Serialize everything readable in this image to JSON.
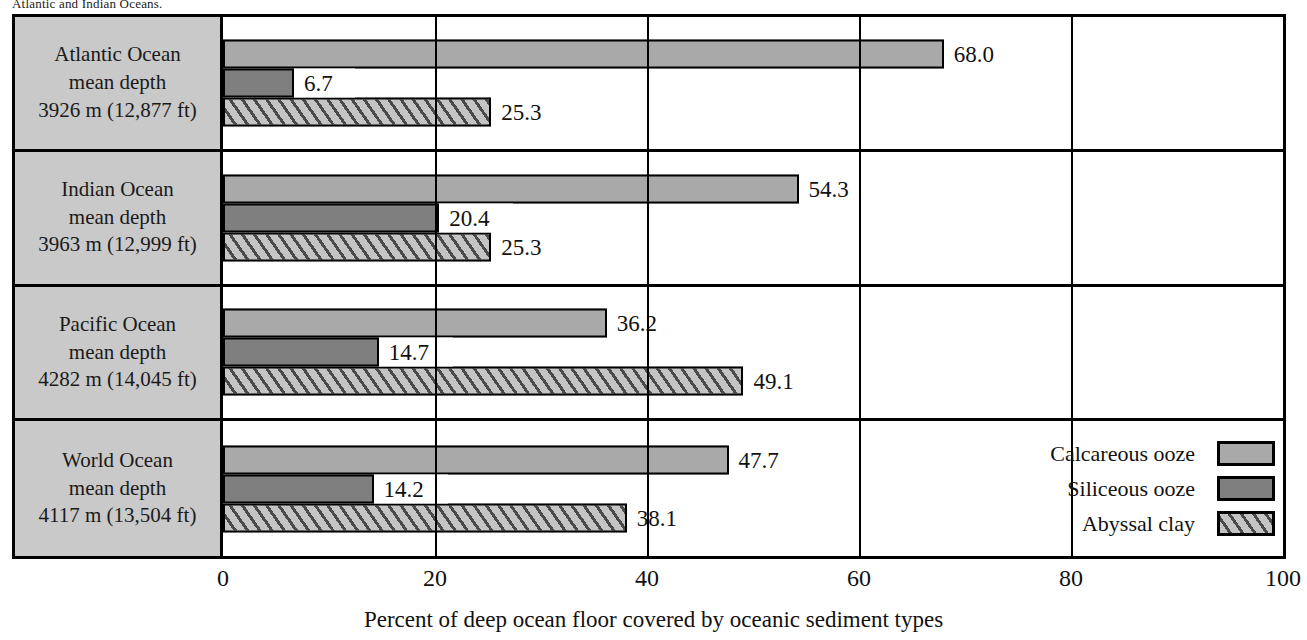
{
  "top_fragment": "Atlantic and Indian Oceans.",
  "chart_data": {
    "type": "bar",
    "orientation": "horizontal",
    "title": "",
    "xlabel": "Percent of deep ocean floor covered by oceanic sediment types",
    "ylabel": "",
    "xlim": [
      0,
      100
    ],
    "xticks": [
      "0",
      "20",
      "40",
      "60",
      "80",
      "100"
    ],
    "grid": true,
    "legend_position": "inside-bottom-right",
    "categories": [
      "Atlantic Ocean mean depth 3926 m (12,877 ft)",
      "Indian Ocean mean depth 3963 m (12,999 ft)",
      "Pacific Ocean mean depth 4282 m (14,045 ft)",
      "World Ocean mean depth 4117 m (13,504 ft)"
    ],
    "series": [
      {
        "name": "Calcareous ooze",
        "values": [
          68.0,
          54.3,
          36.2,
          47.7
        ]
      },
      {
        "name": "Siliceous ooze",
        "values": [
          6.7,
          20.4,
          14.7,
          14.2
        ]
      },
      {
        "name": "Abyssal clay",
        "values": [
          25.3,
          25.3,
          49.1,
          38.1
        ]
      }
    ]
  },
  "rows": [
    {
      "name_line": "Atlantic Ocean",
      "depth_line": "mean depth",
      "value_line": "3926 m (12,877 ft)",
      "bars": [
        {
          "type": "calcareous",
          "value": 68.0,
          "label": "68.0"
        },
        {
          "type": "siliceous",
          "value": 6.7,
          "label": "6.7"
        },
        {
          "type": "clay",
          "value": 25.3,
          "label": "25.3"
        }
      ]
    },
    {
      "name_line": "Indian Ocean",
      "depth_line": "mean depth",
      "value_line": "3963 m (12,999 ft)",
      "bars": [
        {
          "type": "calcareous",
          "value": 54.3,
          "label": "54.3"
        },
        {
          "type": "siliceous",
          "value": 20.4,
          "label": "20.4"
        },
        {
          "type": "clay",
          "value": 25.3,
          "label": "25.3"
        }
      ]
    },
    {
      "name_line": "Pacific Ocean",
      "depth_line": "mean depth",
      "value_line": "4282 m (14,045 ft)",
      "bars": [
        {
          "type": "calcareous",
          "value": 36.2,
          "label": "36.2"
        },
        {
          "type": "siliceous",
          "value": 14.7,
          "label": "14.7"
        },
        {
          "type": "clay",
          "value": 49.1,
          "label": "49.1"
        }
      ]
    },
    {
      "name_line": "World Ocean",
      "depth_line": "mean depth",
      "value_line": "4117 m (13,504 ft)",
      "bars": [
        {
          "type": "calcareous",
          "value": 47.7,
          "label": "47.7"
        },
        {
          "type": "siliceous",
          "value": 14.2,
          "label": "14.2"
        },
        {
          "type": "clay",
          "value": 38.1,
          "label": "38.1"
        }
      ]
    }
  ],
  "legend": [
    {
      "label": "Calcareous ooze",
      "type": "calcareous"
    },
    {
      "label": "Siliceous ooze",
      "type": "siliceous"
    },
    {
      "label": "Abyssal clay",
      "type": "clay"
    }
  ],
  "colors": {
    "calcareous": "#a9a9a9",
    "siliceous": "#7f7f7f",
    "clay": "#c4c4c4",
    "frame": "#000000",
    "label_box": "#c9c9c9"
  }
}
